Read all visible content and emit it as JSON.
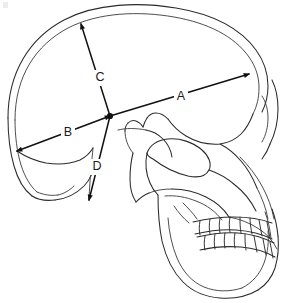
{
  "figure": {
    "background_color": "#ffffff",
    "line_color": "#2b2b2b",
    "measure_color": "#111111"
  },
  "measurements": [
    {
      "id": "A",
      "label": "A",
      "label_x": 181,
      "label_y": 97,
      "x1": 110,
      "y1": 116,
      "x2": 249,
      "y2": 74,
      "endpoint_start": false,
      "endpoint_end": true
    },
    {
      "id": "B",
      "label": "B",
      "label_x": 68,
      "label_y": 133,
      "x1": 110,
      "y1": 116,
      "x2": 17,
      "y2": 151,
      "endpoint_start": true,
      "endpoint_end": true
    },
    {
      "id": "C",
      "label": "C",
      "label_x": 100,
      "label_y": 78,
      "x1": 110,
      "y1": 116,
      "x2": 81,
      "y2": 24,
      "endpoint_start": false,
      "endpoint_end": true
    },
    {
      "id": "D",
      "label": "D",
      "label_x": 97,
      "label_y": 167,
      "x1": 110,
      "y1": 116,
      "x2": 89,
      "y2": 200,
      "endpoint_start": false,
      "endpoint_end": true
    }
  ],
  "center_point": {
    "name": "intersection-point",
    "x": 110,
    "y": 116
  },
  "skull_parts": [
    {
      "name": "cranial-vault-outer",
      "label": "Cranial vault outer table"
    },
    {
      "name": "cranial-vault-inner",
      "label": "Cranial vault inner table"
    },
    {
      "name": "occipital-bone",
      "label": "Occipital bone"
    },
    {
      "name": "temporal-bone",
      "label": "Temporal bone"
    },
    {
      "name": "orbit",
      "label": "Orbit"
    },
    {
      "name": "nasal-aperture",
      "label": "Nasal aperture"
    },
    {
      "name": "zygomatic-arch",
      "label": "Zygomatic arch"
    },
    {
      "name": "maxilla",
      "label": "Maxilla"
    },
    {
      "name": "mandible",
      "label": "Mandible"
    },
    {
      "name": "upper-teeth",
      "label": "Upper dental arcade"
    },
    {
      "name": "lower-teeth",
      "label": "Lower dental arcade"
    }
  ],
  "upper_teeth_count": 8,
  "lower_teeth_count": 8
}
